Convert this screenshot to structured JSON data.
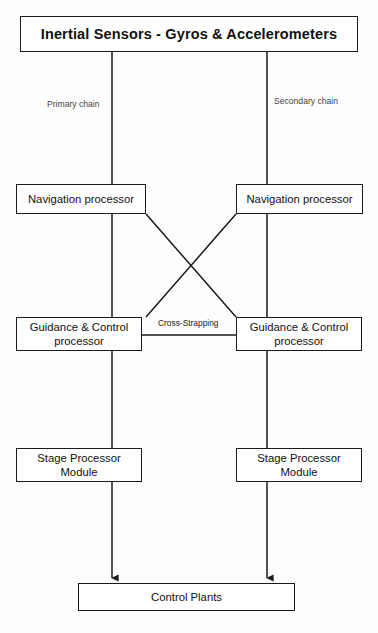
{
  "diagram": {
    "title_box": {
      "label": "Inertial Sensors - Gyros & Accelerometers"
    },
    "chain_labels": {
      "primary": "Primary chain",
      "secondary": "Secondary chain"
    },
    "cross_strapping_label": "Cross-Strapping",
    "nodes": {
      "nav_left": "Navigation processor",
      "nav_right": "Navigation processor",
      "gnc_left_line1": "Guidance & Control",
      "gnc_left_line2": "processor",
      "gnc_right_line1": "Guidance & Control",
      "gnc_right_line2": "processor",
      "spm_left_line1": "Stage Processor",
      "spm_left_line2": "Module",
      "spm_right_line1": "Stage Processor",
      "spm_right_line2": "Module",
      "control_plants": "Control Plants"
    },
    "colors": {
      "stroke": "#1a1a1a",
      "background": "#fdfdfd",
      "text": "#111111",
      "label_text": "#3a3a3a"
    }
  }
}
